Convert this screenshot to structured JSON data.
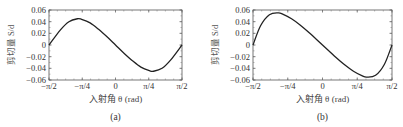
{
  "figure": {
    "panels": [
      {
        "label": "(a)",
        "ylabel": "剪切量 S/d",
        "xlabel": "入射角 θ (rad)"
      },
      {
        "label": "(b)",
        "ylabel": "剪切量 S/d",
        "xlabel": "入射角 θ (rad)"
      }
    ],
    "xticks": [
      "−π/2",
      "−π/4",
      "0",
      "π/4",
      "π/2"
    ],
    "yticks": [
      "0.06",
      "0.04",
      "0.02",
      "0",
      "−0.02",
      "−0.04",
      "−0.06"
    ]
  },
  "chart_data": [
    {
      "type": "line",
      "title": "(a)",
      "xlabel": "入射角 θ (rad)",
      "ylabel": "剪切量 S/d",
      "xlim": [
        -1.5708,
        1.5708
      ],
      "ylim": [
        -0.06,
        0.06
      ],
      "xtick_labels": [
        "−π/2",
        "−π/4",
        "0",
        "π/4",
        "π/2"
      ],
      "ytick_labels": [
        "−0.06",
        "−0.04",
        "−0.02",
        "0",
        "0.02",
        "0.04",
        "0.06"
      ],
      "grid": false,
      "series": [
        {
          "name": "S/d",
          "x": [
            -1.5708,
            -1.3,
            -1.1,
            -0.9,
            -0.8,
            -0.6,
            -0.4,
            -0.2,
            0,
            0.2,
            0.4,
            0.6,
            0.8,
            0.9,
            1.1,
            1.3,
            1.5708
          ],
          "y": [
            0.0,
            0.026,
            0.04,
            0.045,
            0.044,
            0.038,
            0.027,
            0.014,
            0.0,
            -0.014,
            -0.027,
            -0.038,
            -0.044,
            -0.045,
            -0.04,
            -0.026,
            0.0
          ]
        }
      ]
    },
    {
      "type": "line",
      "title": "(b)",
      "xlabel": "入射角 θ (rad)",
      "ylabel": "剪切量 S/d",
      "xlim": [
        -1.5708,
        1.5708
      ],
      "ylim": [
        -0.06,
        0.06
      ],
      "xtick_labels": [
        "−π/2",
        "−π/4",
        "0",
        "π/4",
        "π/2"
      ],
      "ytick_labels": [
        "−0.06",
        "−0.04",
        "−0.02",
        "0",
        "0.02",
        "0.04",
        "0.06"
      ],
      "grid": false,
      "series": [
        {
          "name": "S/d",
          "x": [
            -1.5708,
            -1.4,
            -1.2,
            -1.0,
            -0.9,
            -0.7,
            -0.5,
            -0.3,
            0,
            0.3,
            0.5,
            0.7,
            0.9,
            1.0,
            1.2,
            1.4,
            1.5708
          ],
          "y": [
            0.0,
            0.033,
            0.052,
            0.055,
            0.053,
            0.045,
            0.034,
            0.021,
            0.0,
            -0.021,
            -0.034,
            -0.045,
            -0.053,
            -0.055,
            -0.052,
            -0.033,
            0.0
          ]
        }
      ]
    }
  ]
}
